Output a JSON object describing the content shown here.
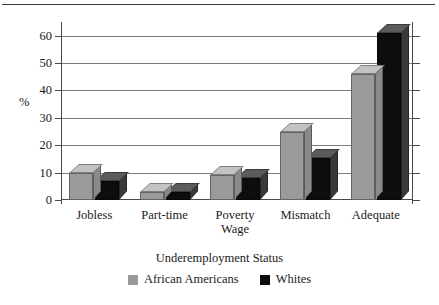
{
  "chart_data": {
    "type": "bar",
    "title": "",
    "xlabel": "Underemployment Status",
    "ylabel": "%",
    "ylim": [
      0,
      65
    ],
    "yticks": [
      0,
      10,
      20,
      30,
      40,
      50,
      60
    ],
    "ytick_labels": [
      "0",
      "10",
      "20",
      "30",
      "40",
      "50",
      "60"
    ],
    "grid": true,
    "legend_position": "bottom",
    "style": "3d-bar",
    "categories": [
      "Jobless",
      "Part-time",
      "Poverty Wage",
      "Mismatch",
      "Adequate"
    ],
    "category_lines": [
      [
        "Jobless"
      ],
      [
        "Part-time"
      ],
      [
        "Poverty",
        "Wage"
      ],
      [
        "Mismatch"
      ],
      [
        "Adequate"
      ]
    ],
    "series": [
      {
        "name": "African Americans",
        "color": "#9a9a9a",
        "values": [
          10,
          3,
          9,
          25,
          46
        ]
      },
      {
        "name": "Whites",
        "color": "#0d0d0d",
        "values": [
          7,
          3,
          8,
          15.5,
          61
        ]
      }
    ]
  },
  "legend": {
    "items": [
      {
        "label": "African Americans",
        "swatch": "gray"
      },
      {
        "label": "Whites",
        "swatch": "black"
      }
    ]
  }
}
